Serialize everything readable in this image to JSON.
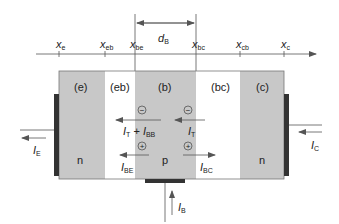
{
  "diagram": {
    "colors": {
      "region_fill": "#c8c8c8",
      "space_charge_fill": "#ffffff",
      "contact": "#333333",
      "lines": "#555555"
    },
    "axis": {
      "ticks": [
        {
          "id": "xe",
          "var": "x",
          "sub": "e",
          "x": 59
        },
        {
          "id": "xeb",
          "var": "x",
          "sub": "eb",
          "x": 105
        },
        {
          "id": "xbe",
          "var": "x",
          "sub": "be",
          "x": 135
        },
        {
          "id": "xbc",
          "var": "x",
          "sub": "bc",
          "x": 196
        },
        {
          "id": "xcb",
          "var": "x",
          "sub": "cb",
          "x": 240
        },
        {
          "id": "xc",
          "var": "x",
          "sub": "c",
          "x": 284
        }
      ]
    },
    "dimension": {
      "var": "d",
      "sub": "B"
    },
    "regions": [
      {
        "id": "e",
        "label": "(e)",
        "doping": "n",
        "type": "neutral"
      },
      {
        "id": "eb",
        "label": "(eb)",
        "doping": "",
        "type": "space-charge"
      },
      {
        "id": "b",
        "label": "(b)",
        "doping": "p",
        "type": "neutral"
      },
      {
        "id": "bc",
        "label": "(bc)",
        "doping": "",
        "type": "space-charge"
      },
      {
        "id": "c",
        "label": "(c)",
        "doping": "n",
        "type": "neutral"
      }
    ],
    "carriers": {
      "electron": "−",
      "hole": "+"
    },
    "currents": {
      "IE": {
        "var": "I",
        "sub": "E"
      },
      "IC": {
        "var": "I",
        "sub": "C"
      },
      "IB": {
        "var": "I",
        "sub": "B"
      },
      "IT_IBB": {
        "var1": "I",
        "sub1": "T",
        "op": " + ",
        "var2": "I",
        "sub2": "BB"
      },
      "IT": {
        "var": "I",
        "sub": "T"
      },
      "IBE": {
        "var": "I",
        "sub": "BE"
      },
      "IBC": {
        "var": "I",
        "sub": "BC"
      }
    }
  }
}
